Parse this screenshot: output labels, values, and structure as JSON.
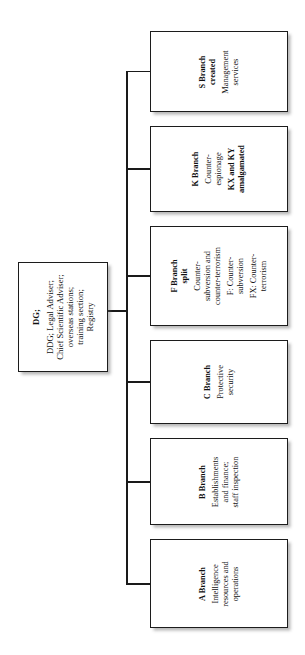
{
  "diagram": {
    "orientation": "rotated-90-ccw",
    "line_color": "#1a1a1a",
    "box_border_color": "#1c1c1c",
    "box_fill": "#ffffff",
    "background": "#ffffff"
  },
  "root": {
    "id": "dg",
    "lines": [
      {
        "text": "DG;",
        "bold": true,
        "gap": false
      },
      {
        "text": "DDG; Legal Adviser;",
        "bold": false,
        "gap": true
      },
      {
        "text": "Chief Scientific Adviser;",
        "bold": false,
        "gap": false
      },
      {
        "text": "overseas stations;",
        "bold": false,
        "gap": false
      },
      {
        "text": "training section;",
        "bold": false,
        "gap": false
      },
      {
        "text": "Registry",
        "bold": false,
        "gap": false
      }
    ]
  },
  "branches": [
    {
      "id": "s",
      "name": "S Branch",
      "lines": [
        {
          "text": "S Branch",
          "bold": true,
          "gap": false
        },
        {
          "text": "created",
          "bold": true,
          "gap": false
        },
        {
          "text": "Management",
          "bold": false,
          "gap": true
        },
        {
          "text": "services",
          "bold": false,
          "gap": false
        }
      ]
    },
    {
      "id": "k",
      "name": "K Branch",
      "lines": [
        {
          "text": "K Branch",
          "bold": true,
          "gap": false
        },
        {
          "text": "Counter-",
          "bold": false,
          "gap": true
        },
        {
          "text": "espionage",
          "bold": false,
          "gap": false
        },
        {
          "text": "KX and KY",
          "bold": true,
          "gap": true
        },
        {
          "text": "amalgamated",
          "bold": true,
          "gap": false
        }
      ]
    },
    {
      "id": "f",
      "name": "F Branch",
      "lines": [
        {
          "text": "F Branch",
          "bold": true,
          "gap": false
        },
        {
          "text": "split",
          "bold": true,
          "gap": false
        },
        {
          "text": "Counter-",
          "bold": false,
          "gap": true
        },
        {
          "text": "subversion and",
          "bold": false,
          "gap": false
        },
        {
          "text": "counter-terrorism",
          "bold": false,
          "gap": false
        },
        {
          "text": "F: Counter-",
          "bold": false,
          "gap": true
        },
        {
          "text": "subversion",
          "bold": false,
          "gap": false
        },
        {
          "text": "FX: Counter-",
          "bold": false,
          "gap": true
        },
        {
          "text": "terrorism",
          "bold": false,
          "gap": false
        }
      ]
    },
    {
      "id": "c",
      "name": "C Branch",
      "lines": [
        {
          "text": "C Branch",
          "bold": true,
          "gap": false
        },
        {
          "text": "Protective",
          "bold": false,
          "gap": true
        },
        {
          "text": "security",
          "bold": false,
          "gap": false
        }
      ]
    },
    {
      "id": "b",
      "name": "B Branch",
      "lines": [
        {
          "text": "B Branch",
          "bold": true,
          "gap": false
        },
        {
          "text": "Establishments",
          "bold": false,
          "gap": true
        },
        {
          "text": "and finance;",
          "bold": false,
          "gap": false
        },
        {
          "text": "staff inspection",
          "bold": false,
          "gap": false
        }
      ]
    },
    {
      "id": "a",
      "name": "A Branch",
      "lines": [
        {
          "text": "A Branch",
          "bold": true,
          "gap": false
        },
        {
          "text": "Intelligence",
          "bold": false,
          "gap": true
        },
        {
          "text": "resources and",
          "bold": false,
          "gap": false
        },
        {
          "text": "operations",
          "bold": false,
          "gap": false
        }
      ]
    }
  ]
}
